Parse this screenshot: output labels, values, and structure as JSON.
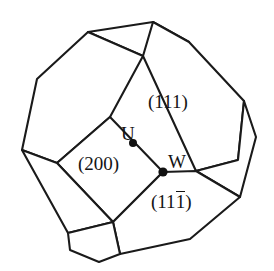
{
  "figure": {
    "name": "truncated-octahedron-wigner-seitz-cell",
    "background_color": "#ffffff",
    "line_color": "#1a1a1a",
    "text_color": "#141414"
  },
  "plane_labels": {
    "top_right": "(111)",
    "left_center": "(200)",
    "bottom_right_prefix": "(11",
    "bottom_right_barred_index": "1",
    "bottom_right_suffix": ")",
    "bottom_right_full": "(111̅)"
  },
  "point_labels": {
    "u": "U",
    "w": "W"
  },
  "vertex_markers": [
    {
      "name": "point-u-dot",
      "x": 133,
      "y": 143,
      "r": 4.0
    },
    {
      "name": "point-w-dot",
      "x": 163,
      "y": 172,
      "r": 4.6
    }
  ],
  "geometry": {
    "faces": [
      {
        "name": "top-square-face",
        "points": "88,32 153,22 189,42 143,56"
      },
      {
        "name": "upper-left-hexagon-face",
        "points": "88,32 143,56 110,117 57,163 22,150 37,79"
      },
      {
        "name": "upper-right-hexagon-face",
        "points": "153,22 189,42 244,101 238,160 196,171 143,56"
      },
      {
        "name": "center-square-face-200",
        "points": "110,117 163,172 113,222 57,163"
      },
      {
        "name": "right-hexagon-face",
        "points": "244,101 256,137 240,197 196,171 238,160"
      },
      {
        "name": "bottom-right-hexagon-face",
        "points": "163,172 196,171 240,197 190,239 120,254 113,222"
      },
      {
        "name": "lower-left-square-face",
        "points": "22,150 57,163 113,222 68,233"
      },
      {
        "name": "bottom-left-hexagon-face",
        "points": "68,233 113,222 120,254 99,262 70,250"
      }
    ]
  }
}
